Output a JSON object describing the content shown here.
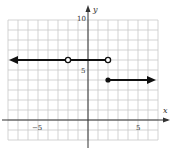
{
  "chart_data": {
    "type": "line",
    "title": "",
    "xlabel": "x",
    "ylabel": "y",
    "xlim": [
      -8,
      7
    ],
    "ylim": [
      -2,
      10
    ],
    "grid": true,
    "x_tick_labels": [
      "−5",
      "5"
    ],
    "y_tick_labels": [
      "10",
      "5"
    ],
    "series": [
      {
        "name": "piece-1",
        "y": 6,
        "x_from": "-infinity",
        "x_to": 2,
        "left_arrow": true,
        "right_endpoint": {
          "x": 2,
          "y": 6,
          "closed": false
        },
        "open_points": [
          {
            "x": -2,
            "y": 6
          },
          {
            "x": 2,
            "y": 6
          }
        ]
      },
      {
        "name": "piece-2",
        "y": 4,
        "x_from": 2,
        "x_to": "infinity",
        "right_arrow": true,
        "left_endpoint": {
          "x": 2,
          "y": 4,
          "closed": true
        }
      }
    ]
  },
  "labels": {
    "x_axis": "x",
    "y_axis": "y",
    "x_neg5": "−5",
    "x_pos5": "5",
    "y_10": "10",
    "y_5": "5"
  },
  "colors": {
    "grid": "#c8c8c8",
    "axis": "#333333",
    "curve": "#111111"
  }
}
